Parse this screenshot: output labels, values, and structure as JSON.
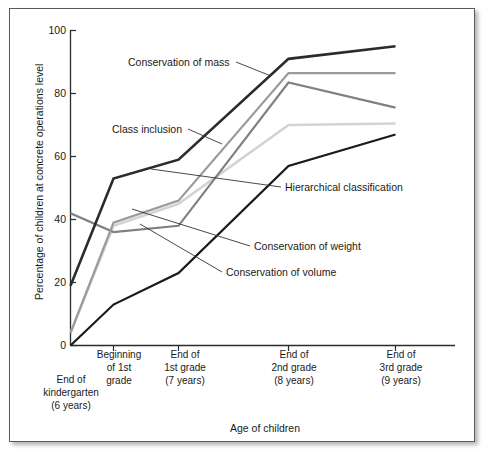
{
  "figure": {
    "alt_role": "line-chart-figure"
  },
  "chart_data": {
    "type": "line",
    "title": "",
    "xlabel": "Age of children",
    "ylabel": "Percentage of children at concrete operations level",
    "ylim": [
      0,
      100
    ],
    "yticks": [
      0,
      20,
      40,
      60,
      80,
      100
    ],
    "ytick_labels": [
      "0",
      "20",
      "40",
      "60",
      "80",
      "100"
    ],
    "grid": false,
    "legend": "inline-annotations",
    "categories": [
      "End of kindergarten (6 years)",
      "Beginning of 1st grade",
      "End of 1st grade (7 years)",
      "End of 2nd grade (8 years)",
      "End of 3rd grade (9 years)"
    ],
    "category_labels": [
      [
        "End of",
        "kindergarten",
        "(6 years)"
      ],
      [
        "Beginning",
        "of 1st",
        "grade"
      ],
      [
        "End of",
        "1st grade",
        "(7 years)"
      ],
      [
        "End of",
        "2nd grade",
        "(8 years)"
      ],
      [
        "End of",
        "3rd grade",
        "(9 years)"
      ]
    ],
    "series": [
      {
        "name": "Conservation of mass",
        "color": "#2b2b2b",
        "width": 2.6,
        "values": [
          19,
          53,
          59,
          91,
          95
        ]
      },
      {
        "name": "Class inclusion",
        "color": "#9a9a9a",
        "width": 2.2,
        "values": [
          4,
          39,
          46,
          86.5,
          86.5
        ]
      },
      {
        "name": "Hierarchical classification",
        "color": "#808080",
        "width": 2.2,
        "values": [
          42,
          36,
          38,
          83.5,
          75.5
        ]
      },
      {
        "name": "Conservation of weight",
        "color": "#d3d3d3",
        "width": 2.6,
        "values": [
          4,
          38,
          45,
          70,
          70.5
        ]
      },
      {
        "name": "Conservation of volume",
        "color": "#1a1a1a",
        "width": 2.2,
        "values": [
          0,
          13,
          23,
          57,
          67
        ]
      }
    ],
    "annotations": [
      {
        "text": "Conservation of mass",
        "series": "Conservation of mass"
      },
      {
        "text": "Class inclusion",
        "series": "Class inclusion"
      },
      {
        "text": "Hierarchical classification",
        "series": "Hierarchical classification"
      },
      {
        "text": "Conservation of weight",
        "series": "Conservation of weight"
      },
      {
        "text": "Conservation of volume",
        "series": "Conservation of volume"
      }
    ]
  }
}
